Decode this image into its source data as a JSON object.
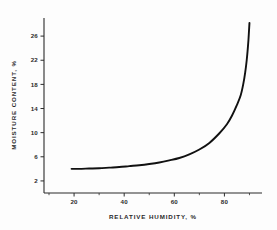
{
  "figure": {
    "background_color": "#fdfdfd",
    "curve_color": "#111111",
    "axis_color": "#2b2b2b"
  },
  "chart_data": {
    "type": "line",
    "title": "",
    "subtitle": "",
    "xlabel": "RELATIVE HUMIDITY, %",
    "ylabel": "MOISTURE CONTENT, %",
    "xlim": [
      8,
      95
    ],
    "ylim": [
      0,
      29
    ],
    "grid": false,
    "legend": null,
    "x_ticks": [
      20,
      40,
      60,
      80
    ],
    "x_tick_labels": [
      "20",
      "40",
      "60",
      "80"
    ],
    "x_minor_ticks": [
      10,
      30,
      50,
      70,
      90
    ],
    "y_ticks": [
      2,
      6,
      10,
      14,
      18,
      22,
      26
    ],
    "y_tick_labels": [
      "2",
      "6",
      "10",
      "14",
      "18",
      "22",
      "26"
    ],
    "series": [
      {
        "name": "moisture sorption isotherm",
        "x": [
          19,
          22,
          26,
          30,
          34,
          38,
          42,
          46,
          50,
          54,
          58,
          62,
          66,
          70,
          74,
          78,
          81,
          83,
          85,
          86.5,
          87.5,
          88.3,
          88.9,
          89.3,
          89.6,
          89.8,
          90.0
        ],
        "y": [
          4.0,
          4.0,
          4.05,
          4.1,
          4.2,
          4.3,
          4.45,
          4.6,
          4.8,
          5.05,
          5.4,
          5.8,
          6.4,
          7.2,
          8.3,
          9.9,
          11.4,
          12.8,
          14.6,
          16.2,
          18.0,
          20.0,
          22.0,
          23.8,
          25.4,
          26.8,
          28.2
        ]
      }
    ],
    "annotations": []
  },
  "axes_text": {
    "x_title": "RELATIVE HUMIDITY, %",
    "y_title": "MOISTURE CONTENT, %",
    "x_labels": [
      "20",
      "40",
      "60",
      "80"
    ],
    "y_labels": [
      "2",
      "6",
      "10",
      "14",
      "18",
      "22",
      "26"
    ]
  }
}
